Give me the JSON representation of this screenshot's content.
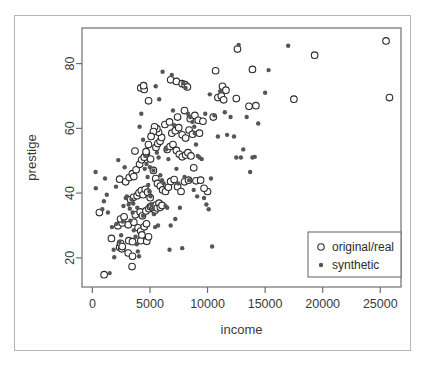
{
  "chart_data": {
    "type": "scatter",
    "title": "",
    "xlabel": "income",
    "ylabel": "prestige",
    "xlim": [
      -900,
      26800
    ],
    "ylim": [
      11,
      91
    ],
    "xticks": [
      0,
      5000,
      10000,
      15000,
      20000,
      25000
    ],
    "xticklabels": [
      "0",
      "5000",
      "10000",
      "15000",
      "20000",
      "25000"
    ],
    "yticks": [
      20,
      40,
      60,
      80
    ],
    "yticklabels": [
      "20",
      "40",
      "60",
      "80"
    ],
    "grid": false,
    "frame": "box",
    "legend": {
      "position": "bottom-right",
      "entries": [
        {
          "label": "original/real",
          "marker": "open-circle",
          "color": "#2b2b2b"
        },
        {
          "label": "synthetic",
          "marker": "filled-circle",
          "color": "#555555"
        }
      ]
    },
    "series": [
      {
        "name": "original/real",
        "marker": "open-circle",
        "color": "#2b2b2b",
        "points": [
          [
            611,
            34.0
          ],
          [
            1656,
            26.0
          ],
          [
            1018,
            14.8
          ],
          [
            2370,
            23.3
          ],
          [
            2448,
            24.5
          ],
          [
            2555,
            22.8
          ],
          [
            2594,
            23.5
          ],
          [
            3116,
            21.5
          ],
          [
            3161,
            25.3
          ],
          [
            3485,
            20.5
          ],
          [
            3447,
            17.3
          ],
          [
            3485,
            25.0
          ],
          [
            4203,
            25.3
          ],
          [
            4723,
            25.1
          ],
          [
            4876,
            26.5
          ],
          [
            2216,
            29.9
          ],
          [
            2594,
            30.8
          ],
          [
            2448,
            32.0
          ],
          [
            2755,
            32.7
          ],
          [
            3116,
            30.2
          ],
          [
            3600,
            31.0
          ],
          [
            3969,
            29.3
          ],
          [
            4200,
            28.3
          ],
          [
            4300,
            27.1
          ],
          [
            4504,
            29.6
          ],
          [
            4700,
            30.5
          ],
          [
            3730,
            33.3
          ],
          [
            4150,
            34.2
          ],
          [
            4350,
            33.0
          ],
          [
            4650,
            34.5
          ],
          [
            4906,
            35.2
          ],
          [
            5052,
            35.8
          ],
          [
            5180,
            36.0
          ],
          [
            5300,
            35.1
          ],
          [
            5450,
            34.7
          ],
          [
            5520,
            36.3
          ],
          [
            5630,
            35.4
          ],
          [
            5790,
            36.9
          ],
          [
            5900,
            35.6
          ],
          [
            6050,
            36.2
          ],
          [
            3319,
            38.0
          ],
          [
            3570,
            38.7
          ],
          [
            3886,
            39.2
          ],
          [
            4050,
            40.1
          ],
          [
            4250,
            40.8
          ],
          [
            4400,
            39.5
          ],
          [
            4590,
            41.2
          ],
          [
            4800,
            40.3
          ],
          [
            5020,
            38.6
          ],
          [
            2370,
            44.3
          ],
          [
            2890,
            43.5
          ],
          [
            3200,
            44.8
          ],
          [
            3473,
            46.0
          ],
          [
            3600,
            45.1
          ],
          [
            3800,
            47.2
          ],
          [
            4100,
            48.9
          ],
          [
            4280,
            50.3
          ],
          [
            4500,
            51.1
          ],
          [
            4690,
            52.4
          ],
          [
            3700,
            53.0
          ],
          [
            5050,
            50.5
          ],
          [
            5300,
            47.0
          ],
          [
            5500,
            44.5
          ],
          [
            5650,
            43.0
          ],
          [
            5900,
            42.2
          ],
          [
            6100,
            41.0
          ],
          [
            6350,
            40.5
          ],
          [
            6600,
            41.8
          ],
          [
            6800,
            43.6
          ],
          [
            7100,
            44.2
          ],
          [
            7400,
            42.0
          ],
          [
            7700,
            40.5
          ],
          [
            8000,
            43.5
          ],
          [
            8350,
            44.0
          ],
          [
            9000,
            43.8
          ],
          [
            5520,
            54.1
          ],
          [
            5680,
            55.3
          ],
          [
            5880,
            56.0
          ],
          [
            6010,
            57.2
          ],
          [
            5750,
            58.8
          ],
          [
            5600,
            59.9
          ],
          [
            5400,
            60.5
          ],
          [
            5300,
            59.0
          ],
          [
            5100,
            57.5
          ],
          [
            4870,
            55.0
          ],
          [
            4660,
            52.8
          ],
          [
            6500,
            53.5
          ],
          [
            6750,
            54.4
          ],
          [
            7000,
            55.0
          ],
          [
            7300,
            53.2
          ],
          [
            7550,
            52.0
          ],
          [
            7800,
            51.2
          ],
          [
            8100,
            51.8
          ],
          [
            8300,
            52.5
          ],
          [
            8560,
            51.5
          ],
          [
            6900,
            58.5
          ],
          [
            7200,
            59.3
          ],
          [
            7500,
            60.2
          ],
          [
            7800,
            58.0
          ],
          [
            8100,
            57.0
          ],
          [
            8400,
            59.5
          ],
          [
            8700,
            58.2
          ],
          [
            6300,
            61.2
          ],
          [
            6700,
            62.0
          ],
          [
            7400,
            63.5
          ],
          [
            8000,
            65.5
          ],
          [
            8500,
            63.0
          ],
          [
            8900,
            64.0
          ],
          [
            9200,
            62.5
          ],
          [
            4200,
            72.5
          ],
          [
            4500,
            72.0
          ],
          [
            4880,
            68.5
          ],
          [
            4450,
            73.2
          ],
          [
            6800,
            75.0
          ],
          [
            7300,
            74.5
          ],
          [
            7800,
            73.8
          ],
          [
            8050,
            73.5
          ],
          [
            8250,
            72.8
          ],
          [
            10700,
            77.8
          ],
          [
            11300,
            73.0
          ],
          [
            11600,
            71.8
          ],
          [
            10900,
            69.5
          ],
          [
            11200,
            70.0
          ],
          [
            12600,
            84.5
          ],
          [
            12500,
            69.2
          ],
          [
            13900,
            78.2
          ],
          [
            13600,
            66.8
          ],
          [
            14200,
            67.0
          ],
          [
            17500,
            69.0
          ],
          [
            19300,
            82.6
          ],
          [
            25500,
            87.0
          ],
          [
            25800,
            69.5
          ],
          [
            11400,
            68.8
          ],
          [
            10500,
            63.5
          ],
          [
            9600,
            62.2
          ],
          [
            9300,
            58.5
          ],
          [
            8800,
            47.8
          ],
          [
            9400,
            44.0
          ],
          [
            10000,
            40.5
          ],
          [
            9700,
            41.5
          ]
        ]
      },
      {
        "name": "synthetic",
        "marker": "filled-circle",
        "color": "#555555",
        "points": [
          [
            280,
            46.5
          ],
          [
            300,
            41.5
          ],
          [
            1100,
            44.5
          ],
          [
            1000,
            37.5
          ],
          [
            1350,
            34.0
          ],
          [
            1700,
            29.5
          ],
          [
            1850,
            22.5
          ],
          [
            1900,
            20.2
          ],
          [
            1500,
            15.3
          ],
          [
            2100,
            30.5
          ],
          [
            2250,
            50.2
          ],
          [
            2500,
            27.0
          ],
          [
            2650,
            31.2
          ],
          [
            2700,
            36.0
          ],
          [
            2900,
            38.5
          ],
          [
            3000,
            39.0
          ],
          [
            3150,
            36.5
          ],
          [
            3250,
            35.2
          ],
          [
            3400,
            38.0
          ],
          [
            3500,
            34.0
          ],
          [
            3600,
            28.5
          ],
          [
            3750,
            26.5
          ],
          [
            3850,
            24.2
          ],
          [
            3950,
            22.0
          ],
          [
            4050,
            20.5
          ],
          [
            4100,
            60.5
          ],
          [
            4250,
            64.5
          ],
          [
            4400,
            56.5
          ],
          [
            4550,
            47.5
          ],
          [
            4700,
            49.0
          ],
          [
            4800,
            45.0
          ],
          [
            4850,
            42.5
          ],
          [
            4950,
            40.5
          ],
          [
            5050,
            39.0
          ],
          [
            5150,
            36.5
          ],
          [
            5250,
            35.0
          ],
          [
            5350,
            33.5
          ],
          [
            5450,
            29.5
          ],
          [
            5600,
            52.5
          ],
          [
            5750,
            51.0
          ],
          [
            5900,
            45.5
          ],
          [
            6050,
            44.0
          ],
          [
            6200,
            43.0
          ],
          [
            6350,
            36.0
          ],
          [
            6500,
            35.5
          ],
          [
            6700,
            22.5
          ],
          [
            6900,
            76.5
          ],
          [
            7000,
            65.5
          ],
          [
            7100,
            61.0
          ],
          [
            7300,
            47.5
          ],
          [
            7450,
            43.0
          ],
          [
            7600,
            35.5
          ],
          [
            7800,
            23.0
          ],
          [
            6100,
            77.5
          ],
          [
            5500,
            73.0
          ],
          [
            5800,
            69.0
          ],
          [
            6400,
            53.5
          ],
          [
            6600,
            50.5
          ],
          [
            7900,
            74.0
          ],
          [
            8100,
            72.5
          ],
          [
            8300,
            64.5
          ],
          [
            8500,
            63.5
          ],
          [
            8700,
            62.0
          ],
          [
            8850,
            60.5
          ],
          [
            8900,
            58.5
          ],
          [
            9000,
            55.0
          ],
          [
            9150,
            51.5
          ],
          [
            9300,
            51.0
          ],
          [
            9500,
            50.5
          ],
          [
            9700,
            38.5
          ],
          [
            9900,
            36.5
          ],
          [
            10100,
            35.0
          ],
          [
            10400,
            23.5
          ],
          [
            9800,
            64.5
          ],
          [
            10200,
            70.5
          ],
          [
            10600,
            64.0
          ],
          [
            10900,
            57.5
          ],
          [
            11100,
            71.5
          ],
          [
            11500,
            65.0
          ],
          [
            12000,
            63.5
          ],
          [
            12300,
            57.5
          ],
          [
            12500,
            51.0
          ],
          [
            12700,
            85.8
          ],
          [
            12900,
            51.0
          ],
          [
            13100,
            53.5
          ],
          [
            13400,
            63.5
          ],
          [
            13700,
            46.5
          ],
          [
            13900,
            51.0
          ],
          [
            14100,
            51.2
          ],
          [
            14400,
            61.5
          ],
          [
            15000,
            71.0
          ],
          [
            15300,
            78.0
          ],
          [
            17000,
            85.5
          ],
          [
            2050,
            42.0
          ],
          [
            1250,
            39.5
          ],
          [
            2350,
            25.0
          ],
          [
            3300,
            31.5
          ],
          [
            4600,
            51.5
          ],
          [
            5000,
            48.0
          ],
          [
            5300,
            47.0
          ],
          [
            8000,
            45.0
          ],
          [
            8400,
            44.0
          ],
          [
            8800,
            41.0
          ],
          [
            5700,
            30.0
          ],
          [
            4400,
            33.0
          ],
          [
            3900,
            35.5
          ],
          [
            3550,
            36.8
          ],
          [
            6800,
            30.0
          ],
          [
            7200,
            32.0
          ],
          [
            2800,
            48.0
          ],
          [
            860,
            35.0
          ],
          [
            9100,
            39.0
          ],
          [
            11700,
            58.0
          ],
          [
            10300,
            44.5
          ]
        ]
      }
    ]
  },
  "axis": {
    "x_title": "income",
    "y_title": "prestige"
  }
}
